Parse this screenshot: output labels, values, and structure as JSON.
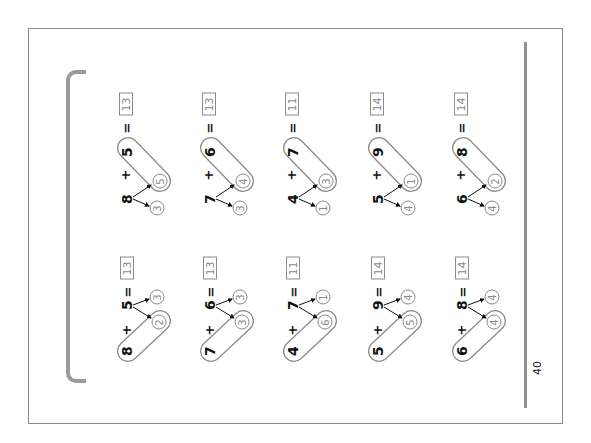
{
  "page": {
    "number": "40",
    "orientation": "rotated -90deg"
  },
  "top_row": [
    {
      "addend1": "8",
      "plus": "+",
      "addend2": "5",
      "equals": "=",
      "answer": "13",
      "split_of_addend1": [
        "3",
        "5"
      ],
      "make_ten_part": "5",
      "leftover": "3"
    },
    {
      "addend1": "7",
      "plus": "+",
      "addend2": "6",
      "equals": "=",
      "answer": "13",
      "split_of_addend1": [
        "3",
        "4"
      ],
      "make_ten_part": "4",
      "leftover": "3"
    },
    {
      "addend1": "4",
      "plus": "+",
      "addend2": "7",
      "equals": "=",
      "answer": "11",
      "split_of_addend1": [
        "1",
        "3"
      ],
      "make_ten_part": "3",
      "leftover": "1"
    },
    {
      "addend1": "5",
      "plus": "+",
      "addend2": "9",
      "equals": "=",
      "answer": "14",
      "split_of_addend1": [
        "4",
        "1"
      ],
      "make_ten_part": "1",
      "leftover": "4"
    },
    {
      "addend1": "6",
      "plus": "+",
      "addend2": "8",
      "equals": "=",
      "answer": "14",
      "split_of_addend1": [
        "4",
        "2"
      ],
      "make_ten_part": "2",
      "leftover": "4"
    }
  ],
  "bottom_row": [
    {
      "addend1": "8",
      "plus": "+",
      "addend2": "5",
      "equals": "=",
      "answer": "13",
      "make_ten_part": "2",
      "leftover": "3"
    },
    {
      "addend1": "7",
      "plus": "+",
      "addend2": "6",
      "equals": "=",
      "answer": "13",
      "make_ten_part": "3",
      "leftover": "3"
    },
    {
      "addend1": "4",
      "plus": "+",
      "addend2": "7",
      "equals": "=",
      "answer": "11",
      "make_ten_part": "6",
      "leftover": "1"
    },
    {
      "addend1": "5",
      "plus": "+",
      "addend2": "9",
      "equals": "=",
      "answer": "14",
      "make_ten_part": "5",
      "leftover": "4"
    },
    {
      "addend1": "6",
      "plus": "+",
      "addend2": "8",
      "equals": "=",
      "answer": "14",
      "make_ten_part": "4",
      "leftover": "4"
    }
  ],
  "colors": {
    "frame": "#8a8a8a",
    "bracket": "#9a9a9a",
    "answer_text": "#8a8a8a",
    "number_text": "#111111"
  }
}
